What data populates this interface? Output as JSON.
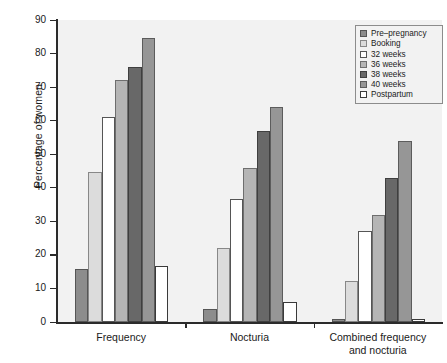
{
  "chart_data": {
    "type": "bar",
    "title": "",
    "xlabel": "",
    "ylabel": "Percentage of women",
    "ylim": [
      0,
      90
    ],
    "yticks": [
      0,
      10,
      20,
      30,
      40,
      50,
      60,
      70,
      80,
      90
    ],
    "grid": false,
    "legend_position": "top-right",
    "categories": [
      "Frequency",
      "Nocturia",
      "Combined frequency and nocturia"
    ],
    "category_labels": [
      [
        "Frequency"
      ],
      [
        "Nocturia"
      ],
      [
        "Combined frequency",
        "and nocturia"
      ]
    ],
    "series": [
      {
        "name": "Pre–pregnancy",
        "color": "#8c8c8c",
        "edge": "#555555",
        "values": [
          15.8,
          4.0,
          0.8
        ]
      },
      {
        "name": "Booking",
        "color": "#dcdcdc",
        "edge": "#888888",
        "values": [
          44.7,
          22.0,
          12.2
        ]
      },
      {
        "name": "32 weeks",
        "color": "#ffffff",
        "edge": "#555555",
        "values": [
          61.0,
          36.8,
          27.0
        ]
      },
      {
        "name": "36 weeks",
        "color": "#b5b5b5",
        "edge": "#6e6e6e",
        "values": [
          72.0,
          46.0,
          32.0
        ]
      },
      {
        "name": "38 weeks",
        "color": "#686868",
        "edge": "#3f3f3f",
        "values": [
          76.0,
          57.0,
          43.0
        ]
      },
      {
        "name": "40 weeks",
        "color": "#969696",
        "edge": "#5c5c5c",
        "values": [
          84.7,
          64.0,
          54.0
        ]
      },
      {
        "name": "Postpartum",
        "color": "#ffffff",
        "edge": "#3a3a3a",
        "values": [
          16.7,
          6.0,
          0.8
        ]
      }
    ]
  },
  "colors": {
    "plot_background": "#f2f2f2",
    "page_background": "#ffffff",
    "axis": "#2b2b2b",
    "text": "#1a1a1a",
    "legend_border": "#8c8c8c"
  }
}
